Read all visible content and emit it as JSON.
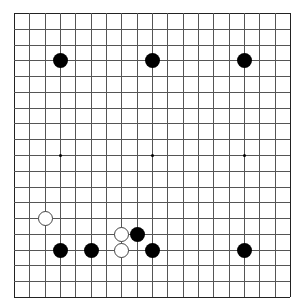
{
  "board": {
    "size": 19,
    "origin_px": [
      14,
      13
    ],
    "extent_px": [
      276,
      284
    ],
    "line_color": "#555555",
    "hoshi": [
      [
        3,
        3
      ],
      [
        9,
        3
      ],
      [
        15,
        3
      ],
      [
        3,
        9
      ],
      [
        9,
        9
      ],
      [
        15,
        9
      ],
      [
        3,
        15
      ],
      [
        9,
        15
      ],
      [
        15,
        15
      ]
    ],
    "stones": [
      {
        "color": "black",
        "col": 3,
        "row": 3
      },
      {
        "color": "black",
        "col": 9,
        "row": 3
      },
      {
        "color": "black",
        "col": 15,
        "row": 3
      },
      {
        "color": "white",
        "col": 2,
        "row": 13
      },
      {
        "color": "white",
        "col": 7,
        "row": 14
      },
      {
        "color": "black",
        "col": 8,
        "row": 14
      },
      {
        "color": "black",
        "col": 3,
        "row": 15
      },
      {
        "color": "black",
        "col": 5,
        "row": 15
      },
      {
        "color": "white",
        "col": 7,
        "row": 15
      },
      {
        "color": "black",
        "col": 9,
        "row": 15
      },
      {
        "color": "black",
        "col": 15,
        "row": 15
      }
    ]
  }
}
